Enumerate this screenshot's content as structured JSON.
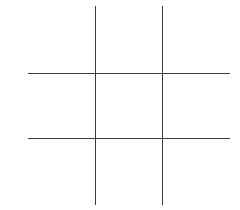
{
  "game": {
    "name": "tic-tac-toe",
    "line_color": "#3a3a3a",
    "cells": [
      "",
      "",
      "",
      "",
      "",
      "",
      "",
      "",
      ""
    ]
  }
}
